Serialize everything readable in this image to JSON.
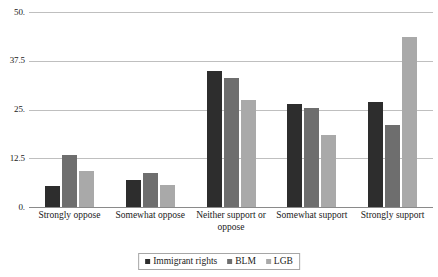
{
  "chart_data": {
    "type": "bar",
    "title": "",
    "subtitle": "",
    "xlabel": "",
    "ylabel": "",
    "ylim": [
      0,
      50
    ],
    "grid": true,
    "legend_position": "bottom",
    "categories": [
      "Strongly oppose",
      "Somewhat oppose",
      "Neither support or oppose",
      "Somewhat support",
      "Strongly support"
    ],
    "y_ticks": [
      0,
      12.5,
      25,
      37.5,
      50
    ],
    "y_tick_labels": [
      "0.",
      "12.5",
      "25.",
      "37.5",
      "50."
    ],
    "series": [
      {
        "name": "Immigrant rights",
        "color": "#2d2d2d",
        "values": [
          5.5,
          7.0,
          35.0,
          26.5,
          27.0
        ]
      },
      {
        "name": "BLM",
        "color": "#6e6e6e",
        "values": [
          13.3,
          8.6,
          33.0,
          25.5,
          21.0
        ]
      },
      {
        "name": "LGB",
        "color": "#a9a9a9",
        "values": [
          9.3,
          5.6,
          27.5,
          18.5,
          43.5
        ]
      }
    ]
  }
}
